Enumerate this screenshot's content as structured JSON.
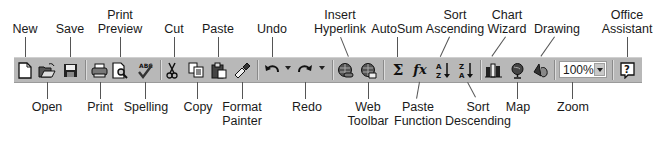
{
  "toolbar": {
    "name": "Standard Toolbar",
    "zoom_value": "100%"
  },
  "labels_top": [
    {
      "id": "new",
      "lines": [
        "New"
      ]
    },
    {
      "id": "save",
      "lines": [
        "Save"
      ]
    },
    {
      "id": "print-preview",
      "lines": [
        "Print",
        "Preview"
      ]
    },
    {
      "id": "cut",
      "lines": [
        "Cut"
      ]
    },
    {
      "id": "paste",
      "lines": [
        "Paste"
      ]
    },
    {
      "id": "undo",
      "lines": [
        "Undo"
      ]
    },
    {
      "id": "insert-hyperlink",
      "lines": [
        "Insert",
        "Hyperlink"
      ]
    },
    {
      "id": "autosum",
      "lines": [
        "AutoSum"
      ]
    },
    {
      "id": "sort-ascending",
      "lines": [
        "Sort",
        "Ascending"
      ]
    },
    {
      "id": "chart-wizard",
      "lines": [
        "Chart",
        "Wizard"
      ]
    },
    {
      "id": "drawing",
      "lines": [
        "Drawing"
      ]
    },
    {
      "id": "office-assistant",
      "lines": [
        "Office",
        "Assistant"
      ]
    }
  ],
  "labels_bottom": [
    {
      "id": "open",
      "lines": [
        "Open"
      ]
    },
    {
      "id": "print",
      "lines": [
        "Print"
      ]
    },
    {
      "id": "spelling",
      "lines": [
        "Spelling"
      ]
    },
    {
      "id": "copy",
      "lines": [
        "Copy"
      ]
    },
    {
      "id": "format-painter",
      "lines": [
        "Format",
        "Painter"
      ]
    },
    {
      "id": "redo",
      "lines": [
        "Redo"
      ]
    },
    {
      "id": "web-toolbar",
      "lines": [
        "Web",
        "Toolbar"
      ]
    },
    {
      "id": "paste-function",
      "lines": [
        "Paste",
        "Function"
      ]
    },
    {
      "id": "sort-descending",
      "lines": [
        "Sort",
        "Descending"
      ]
    },
    {
      "id": "map",
      "lines": [
        "Map"
      ]
    },
    {
      "id": "zoom",
      "lines": [
        "Zoom"
      ]
    }
  ],
  "icons": {
    "autosum_glyph": "Σ",
    "paste_function_glyph": "fx",
    "sort_asc_glyph": "A↓Z",
    "sort_desc_glyph": "Z↓A",
    "help_glyph": "?"
  },
  "colors": {
    "toolbar_bg": "#b8b8b8",
    "label_text": "#1a1a1a",
    "leader_line": "#555555"
  }
}
